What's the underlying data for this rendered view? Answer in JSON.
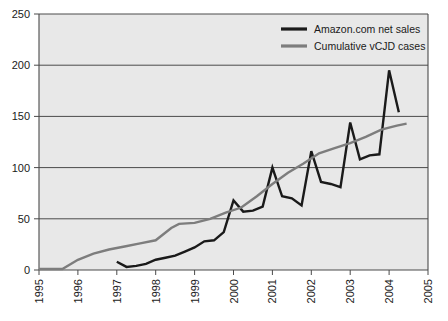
{
  "chart_data": {
    "type": "line",
    "title": "",
    "subtitle": "",
    "xlabel": "",
    "ylabel": "",
    "xlim": [
      1995,
      2005
    ],
    "ylim": [
      0,
      250
    ],
    "grid": true,
    "grid_axis": "y",
    "legend_position": "top-right",
    "plot_background": "#e8e8e8",
    "xticks": [
      "1995",
      "1996",
      "1997",
      "1998",
      "1999",
      "2000",
      "2001",
      "2002",
      "2003",
      "2004",
      "2005"
    ],
    "xtick_values": [
      1995,
      1996,
      1997,
      1998,
      1999,
      2000,
      2001,
      2002,
      2003,
      2004,
      2005
    ],
    "yticks": [
      "0",
      "50",
      "100",
      "150",
      "200",
      "250"
    ],
    "ytick_values": [
      0,
      50,
      100,
      150,
      200,
      250
    ],
    "series": [
      {
        "name": "Amazon.com net sales",
        "color": "#1a1a1a",
        "width": 2.4,
        "x": [
          1997.0,
          1997.25,
          1997.5,
          1997.75,
          1998.0,
          1998.25,
          1998.5,
          1998.75,
          1999.0,
          1999.25,
          1999.5,
          1999.75,
          2000.0,
          2000.25,
          2000.5,
          2000.75,
          2001.0,
          2001.25,
          2001.5,
          2001.75,
          2002.0,
          2002.25,
          2002.5,
          2002.75,
          2003.0,
          2003.25,
          2003.5,
          2003.75,
          2004.0
        ],
        "values": [
          8,
          3,
          4,
          6,
          10,
          12,
          14,
          18,
          22,
          28,
          29,
          37,
          68,
          57,
          58,
          62,
          100,
          72,
          70,
          63,
          116,
          86,
          84,
          81,
          144,
          108,
          112,
          113,
          195
        ],
        "values_tail_x": [
          2004.25
        ],
        "values_tail": [
          154
        ]
      },
      {
        "name": "Cumulative vCJD cases",
        "color": "#7d7d7d",
        "width": 2.4,
        "x": [
          1995.0,
          1995.3,
          1995.6,
          1996.0,
          1996.4,
          1996.8,
          1997.2,
          1997.6,
          1998.0,
          1998.4,
          1998.6,
          1999.0,
          1999.4,
          1999.8,
          2000.2,
          2000.6,
          2001.0,
          2001.4,
          2001.8,
          2002.2,
          2002.6,
          2003.0,
          2003.4,
          2003.8,
          2004.2,
          2004.45
        ],
        "values": [
          1,
          1,
          1,
          10,
          16,
          20,
          23,
          26,
          29,
          41,
          45,
          46,
          50,
          56,
          61,
          72,
          84,
          95,
          104,
          114,
          119,
          124,
          130,
          137,
          141,
          143
        ]
      }
    ],
    "legend": [
      {
        "label": "Amazon.com net sales",
        "color": "#1a1a1a"
      },
      {
        "label": "Cumulative vCJD cases",
        "color": "#7d7d7d"
      }
    ]
  },
  "axis_colors": {
    "axis_line": "#4a4a4a",
    "gridline": "#4a4a4a",
    "tick_label": "#1a1a1a"
  }
}
